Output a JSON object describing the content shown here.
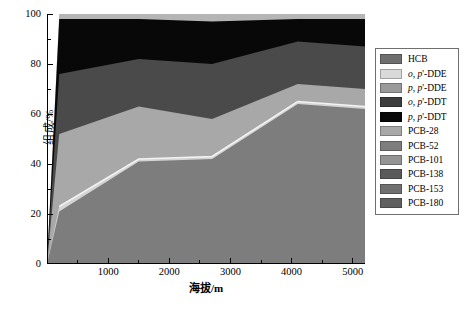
{
  "figure": {
    "background": "#ffffff"
  },
  "axes": {
    "xlabel": "海拔/m",
    "ylabel": "组成/%",
    "xticks": [
      "1000",
      "2000",
      "3000",
      "4000",
      "5000"
    ],
    "yticks": [
      "0",
      "20",
      "40",
      "60",
      "80",
      "100"
    ]
  },
  "legend": {
    "items": [
      {
        "label": "HCB",
        "html": "HCB",
        "color": "#6f6f6f"
      },
      {
        "label": "o, p'-DDE",
        "html": "<i>o, p</i>'-DDE",
        "color": "#d9d9d9"
      },
      {
        "label": "p, p'-DDE",
        "html": "<i>p, p</i>'-DDE",
        "color": "#9a9a9a"
      },
      {
        "label": "o, p'-DDT",
        "html": "<i>o, p</i>'-DDT",
        "color": "#3d3d3d"
      },
      {
        "label": "p, p'-DDT",
        "html": "<i>p, p</i>'-DDT",
        "color": "#080808"
      },
      {
        "label": "PCB-28",
        "html": "PCB-28",
        "color": "#a8a8a8"
      },
      {
        "label": "PCB-52",
        "html": "PCB-52",
        "color": "#7d7d7d"
      },
      {
        "label": "PCB-101",
        "html": "PCB-101",
        "color": "#949494"
      },
      {
        "label": "PCB-138",
        "html": "PCB-138",
        "color": "#5a5a5a"
      },
      {
        "label": "PCB-153",
        "html": "PCB-153",
        "color": "#707070"
      },
      {
        "label": "PCB-180",
        "html": "PCB-180",
        "color": "#606060"
      }
    ]
  },
  "chart_data": {
    "type": "area",
    "title": "",
    "xlabel": "海拔/m",
    "ylabel": "组成/%",
    "xlim": [
      0,
      5200
    ],
    "ylim": [
      0,
      100
    ],
    "grid": false,
    "legend_position": "right",
    "stacked": true,
    "normalized_percent": true,
    "x": [
      200,
      1500,
      2700,
      4100,
      5200
    ],
    "xtick_values": [
      1000,
      2000,
      3000,
      4000,
      5000
    ],
    "ytick_values": [
      0,
      20,
      40,
      60,
      80,
      100
    ],
    "series": [
      {
        "name": "base-band",
        "legend": "HCB + PCB group (lower aggregate)",
        "color": "#7d7d7d",
        "cumulative": [
          21,
          41,
          42,
          64,
          62
        ],
        "values": [
          21,
          41,
          42,
          64,
          62
        ]
      },
      {
        "name": "light-outline-band",
        "legend": "o, p'-DDE",
        "color": "#d4d4d4",
        "cumulative": [
          23,
          42,
          43,
          65,
          63
        ],
        "values": [
          2,
          1,
          1,
          1,
          1
        ]
      },
      {
        "name": "mid-gray-band",
        "legend": "p, p'-DDE",
        "color": "#a8a8a8",
        "cumulative": [
          52,
          63,
          58,
          72,
          70
        ],
        "values": [
          29,
          21,
          15,
          7,
          7
        ]
      },
      {
        "name": "dark-gray-band",
        "legend": "o, p'-DDT",
        "color": "#4a4a4a",
        "cumulative": [
          76,
          82,
          80,
          89,
          87
        ],
        "values": [
          24,
          19,
          22,
          17,
          17
        ]
      },
      {
        "name": "black-band",
        "legend": "p, p'-DDT",
        "color": "#080808",
        "cumulative": [
          98,
          98,
          97,
          98,
          98
        ],
        "values": [
          22,
          16,
          17,
          9,
          11
        ]
      },
      {
        "name": "top-cap-band",
        "legend": "trace top band",
        "color": "#b5b5b5",
        "cumulative": [
          100,
          100,
          100,
          100,
          100
        ],
        "values": [
          2,
          2,
          3,
          2,
          2
        ]
      }
    ]
  }
}
